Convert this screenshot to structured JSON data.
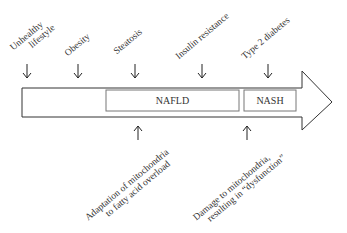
{
  "diagram": {
    "top_labels": [
      {
        "id": "unhealthy-lifestyle",
        "lines": [
          "Unhealthy",
          "lifestyle"
        ]
      },
      {
        "id": "obesity",
        "lines": [
          "Obesity"
        ]
      },
      {
        "id": "steatosis",
        "lines": [
          "Steatosis"
        ]
      },
      {
        "id": "insulin-resistance",
        "lines": [
          "Insulin resistance"
        ]
      },
      {
        "id": "type-2-diabetes",
        "lines": [
          "Type 2 diabetes"
        ]
      }
    ],
    "boxes": {
      "nafld": "NAFLD",
      "nash": "NASH"
    },
    "bottom_labels": [
      {
        "id": "adaptation",
        "lines": [
          "Adaptation of mitochondria",
          "to fatty acid overload"
        ]
      },
      {
        "id": "damage",
        "lines": [
          "Damage to mitochondria,",
          "resulting in “dysfunction”"
        ]
      }
    ]
  }
}
